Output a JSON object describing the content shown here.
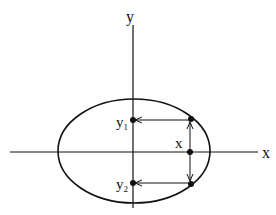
{
  "diagram": {
    "type": "ellipse-with-axes",
    "axes": {
      "x_label": "x",
      "y_label": "y"
    },
    "point_labels": {
      "x": "x",
      "y1_main": "y",
      "y1_sub": "1",
      "y2_main": "y",
      "y2_sub": "2"
    },
    "colors": {
      "stroke": "#111111",
      "background": "#ffffff"
    }
  }
}
